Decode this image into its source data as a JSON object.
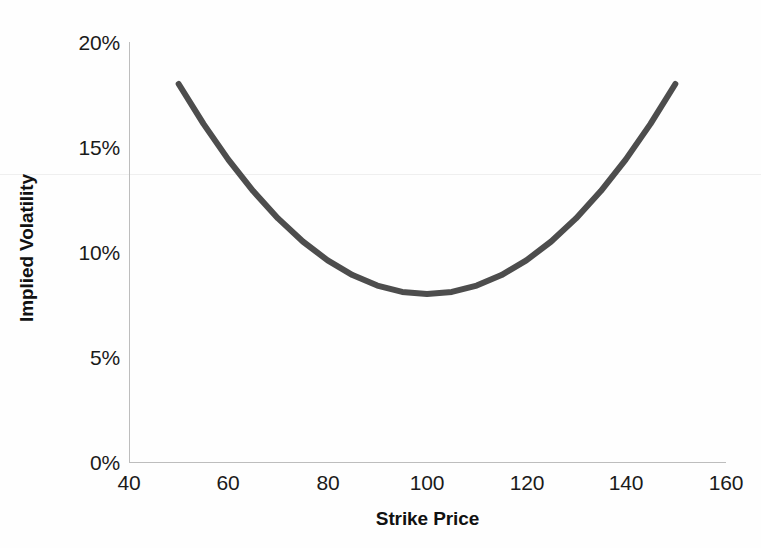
{
  "chart_data": {
    "type": "line",
    "title": "",
    "subtitle": "",
    "xlabel": "Strike Price",
    "ylabel": "Implied Volatility",
    "xlim": [
      40,
      160
    ],
    "ylim": [
      0,
      0.2
    ],
    "xticks": [
      40,
      60,
      80,
      100,
      120,
      140,
      160
    ],
    "xtick_labels": [
      "40",
      "60",
      "80",
      "100",
      "120",
      "140",
      "160"
    ],
    "yticks": [
      0,
      0.05,
      0.1,
      0.15,
      0.2
    ],
    "ytick_labels": [
      "0%",
      "5%",
      "10%",
      "15%",
      "20%"
    ],
    "grid": false,
    "legend": null,
    "annotations": [],
    "series": [
      {
        "name": "Implied Volatility Smile",
        "color": "#4d4d4d",
        "line_width": 6,
        "x": [
          50,
          55,
          60,
          65,
          70,
          75,
          80,
          85,
          90,
          95,
          100,
          105,
          110,
          115,
          120,
          125,
          130,
          135,
          140,
          145,
          150
        ],
        "y": [
          0.18,
          0.161,
          0.144,
          0.129,
          0.116,
          0.105,
          0.096,
          0.089,
          0.084,
          0.081,
          0.08,
          0.081,
          0.084,
          0.089,
          0.096,
          0.105,
          0.116,
          0.129,
          0.144,
          0.161,
          0.18
        ]
      }
    ]
  },
  "axes": {
    "y_ticks": [
      {
        "label": "20%",
        "value": 0.2
      },
      {
        "label": "15%",
        "value": 0.15
      },
      {
        "label": "10%",
        "value": 0.1
      },
      {
        "label": "5%",
        "value": 0.05
      },
      {
        "label": "0%",
        "value": 0.0
      }
    ],
    "x_ticks": [
      {
        "label": "40",
        "value": 40
      },
      {
        "label": "60",
        "value": 60
      },
      {
        "label": "80",
        "value": 80
      },
      {
        "label": "100",
        "value": 100
      },
      {
        "label": "120",
        "value": 120
      },
      {
        "label": "140",
        "value": 140
      },
      {
        "label": "160",
        "value": 160
      }
    ],
    "x_title": "Strike Price",
    "y_title": "Implied Volatility"
  },
  "colors": {
    "curve": "#4d4d4d",
    "axis": "#bdbdbd",
    "text": "#1a1a1a",
    "background": "#fefefe"
  }
}
